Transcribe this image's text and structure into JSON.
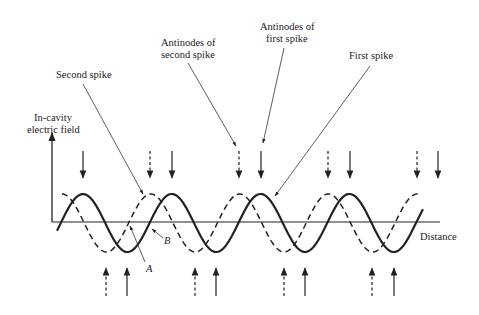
{
  "diagram": {
    "labels": {
      "y_axis_line1": "In-cavity",
      "y_axis_line2": "electric field",
      "x_axis": "Distance",
      "second_spike": "Second spike",
      "antinodes_second_line1": "Antinodes of",
      "antinodes_second_line2": "second spike",
      "antinodes_first_line1": "Antinodes of",
      "antinodes_first_line2": "first spike",
      "first_spike": "First spike",
      "point_a": "A",
      "point_b": "B"
    },
    "waves": [
      {
        "name": "First spike",
        "style": "solid",
        "crest_count": 4,
        "trough_count": 4
      },
      {
        "name": "Second spike",
        "style": "dashed",
        "crest_count": 5,
        "trough_count": 4
      }
    ],
    "colors": {
      "ink": "#222222",
      "background": "#ffffff"
    }
  }
}
